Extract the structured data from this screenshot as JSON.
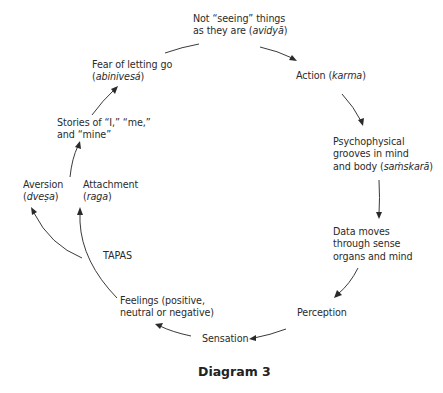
{
  "diagram": {
    "caption": "Diagram 3",
    "nodes": {
      "avidya": {
        "line1": "Not “seeing” things",
        "line2_pre": "as they are (",
        "line2_term": "avidyā",
        "line2_post": ")"
      },
      "action": {
        "pre": "Action (",
        "term": "karma",
        "post": ")"
      },
      "samskara": {
        "line1": "Psychophysical",
        "line2": "grooves in mind",
        "line3_pre": "and body (",
        "line3_term": "saṁskarā",
        "line3_post": ")"
      },
      "data_moves": {
        "line1": "Data moves",
        "line2": "through sense",
        "line3": "organs and mind"
      },
      "perception": {
        "text": "Perception"
      },
      "sensation": {
        "text": "Sensation"
      },
      "feelings": {
        "line1": "Feelings (positive,",
        "line2": "neutral or negative)"
      },
      "tapas": {
        "text": "TAPAS"
      },
      "aversion": {
        "line1": "Aversion",
        "line2_pre": "(",
        "line2_term": "dveṣa",
        "line2_post": ")"
      },
      "attachment": {
        "line1": "Attachment",
        "line2_pre": "(",
        "line2_term": "raga",
        "line2_post": ")"
      },
      "stories": {
        "line1": "Stories of “I,” “me,”",
        "line2": "and “mine”"
      },
      "fear": {
        "line1": "Fear of letting go",
        "line2_pre": "(",
        "line2_term": "abinivesá",
        "line2_post": ")"
      }
    },
    "edges": [
      {
        "from": "avidya",
        "to": "action"
      },
      {
        "from": "action",
        "to": "samskara"
      },
      {
        "from": "samskara",
        "to": "data_moves"
      },
      {
        "from": "data_moves",
        "to": "perception"
      },
      {
        "from": "perception",
        "to": "sensation"
      },
      {
        "from": "sensation",
        "to": "feelings"
      },
      {
        "from": "feelings",
        "to": "attachment"
      },
      {
        "from": "feelings",
        "to": "aversion"
      },
      {
        "from": "attachment",
        "to": "stories"
      },
      {
        "from": "stories",
        "to": "fear"
      },
      {
        "from": "fear",
        "to": "avidya"
      }
    ]
  }
}
